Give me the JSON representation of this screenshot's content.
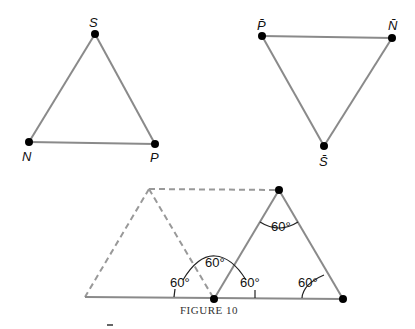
{
  "triangle1": {
    "vertices": {
      "top": "S",
      "left": "N",
      "right": "P"
    }
  },
  "triangle2": {
    "vertices": {
      "left": "P̄",
      "right": "N̄",
      "bottom": "S̄"
    }
  },
  "figure3": {
    "angles": [
      "60°",
      "60°",
      "60°",
      "60°",
      "60°"
    ]
  },
  "caption": "FIGURE 10"
}
